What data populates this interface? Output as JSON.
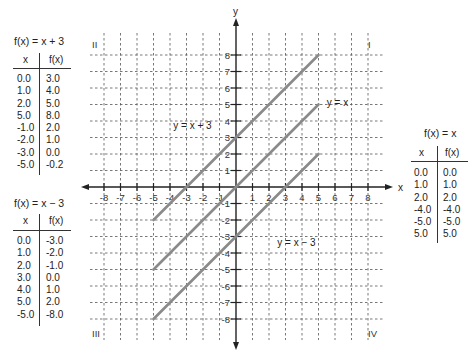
{
  "chart_data": {
    "type": "line",
    "title": "",
    "xlabel": "x",
    "ylabel": "y",
    "xlim": [
      -8,
      8
    ],
    "ylim": [
      -8,
      8
    ],
    "grid": true,
    "x_ticks": [
      "-8",
      "-7",
      "-6",
      "-5",
      "-4",
      "-3",
      "-2",
      "-1",
      "1",
      "2",
      "3",
      "4",
      "5",
      "6",
      "7",
      "8"
    ],
    "y_ticks": [
      "8",
      "7",
      "6",
      "5",
      "4",
      "3",
      "2",
      "1",
      "-1",
      "-2",
      "-3",
      "-4",
      "-5",
      "-6",
      "-7",
      "-8"
    ],
    "quadrant_labels": {
      "I": "I",
      "II": "II",
      "III": "III",
      "IV": "IV"
    },
    "series": [
      {
        "name": "y = x + 3",
        "x": [
          -5,
          5
        ],
        "y": [
          -2,
          8
        ]
      },
      {
        "name": "y = x",
        "x": [
          -5,
          5
        ],
        "y": [
          -5,
          5
        ]
      },
      {
        "name": "y = x − 3",
        "x": [
          -5,
          5
        ],
        "y": [
          -8,
          2
        ]
      }
    ],
    "annotations": [
      {
        "text": "y = x + 3",
        "x": -3.8,
        "y": 3.5
      },
      {
        "text": "y = x",
        "x": 5.5,
        "y": 4.9
      },
      {
        "text": "y = x − 3",
        "x": 2.5,
        "y": -3.6
      }
    ],
    "line_color": "#8a8a8a"
  },
  "tables": {
    "plus3": {
      "title": "f(x) = x + 3",
      "headers": [
        "x",
        "f(x)"
      ],
      "x": [
        "0.0",
        "1.0",
        "2.0",
        "5.0",
        "-1.0",
        "-2.0",
        "-3.0",
        "-5.0"
      ],
      "fx": [
        "3.0",
        "4.0",
        "5.0",
        "8.0",
        "2.0",
        "1.0",
        "0.0",
        "-0.2"
      ]
    },
    "minus3": {
      "title": "f(x) = x − 3",
      "headers": [
        "x",
        "f(x)"
      ],
      "x": [
        "0.0",
        "1.0",
        "2.0",
        "3.0",
        "4.0",
        "5.0",
        "-5.0"
      ],
      "fx": [
        "-3.0",
        "-2.0",
        "-1.0",
        "0.0",
        "1.0",
        "2.0",
        "-8.0"
      ]
    },
    "identity": {
      "title": "f(x) = x",
      "headers": [
        "x",
        "f(x)"
      ],
      "x": [
        "0.0",
        "1.0",
        "2.0",
        "-4.0",
        "-5.0",
        "5.0"
      ],
      "fx": [
        "0.0",
        "1.0",
        "2.0",
        "-4.0",
        "-5.0",
        "5.0"
      ]
    }
  }
}
